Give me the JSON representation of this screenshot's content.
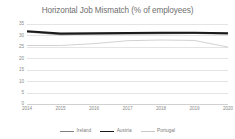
{
  "chart_data": {
    "type": "line",
    "title": "Horizontal Job Mismatch (% of employees)",
    "xlabel": "",
    "ylabel": "",
    "x": [
      "2014",
      "2015",
      "2016",
      "2017",
      "2018",
      "2019",
      "2020"
    ],
    "categories": [
      "2014",
      "2015",
      "2016",
      "2017",
      "2018",
      "2019",
      "2020"
    ],
    "ylim": [
      0,
      35
    ],
    "yticks": [
      35,
      30,
      25,
      20,
      15,
      10,
      5,
      0
    ],
    "grid": "horizontal",
    "legend_position": "bottom",
    "series": [
      {
        "name": "Ireland",
        "color": "#808080",
        "values": [
          31.6,
          30.5,
          30.7,
          30.8,
          30.9,
          31.0,
          30.8
        ]
      },
      {
        "name": "Austria",
        "color": "#1a1a1a",
        "values": [
          31.8,
          30.8,
          30.9,
          31.1,
          31.2,
          31.2,
          31.0
        ]
      },
      {
        "name": "Portugal",
        "color": "#c9c9c9",
        "values": [
          25.6,
          25.6,
          26.4,
          27.7,
          28.0,
          27.8,
          24.9
        ]
      }
    ]
  },
  "axes": {
    "y_tick_labels": [
      "35",
      "30",
      "25",
      "20",
      "15",
      "10",
      "5",
      "0"
    ],
    "x_tick_labels": [
      "2014",
      "2015",
      "2016",
      "2017",
      "2018",
      "2019",
      "2020"
    ]
  },
  "legend": {
    "items": [
      {
        "label": "Ireland",
        "color": "#808080",
        "width": "1.6px"
      },
      {
        "label": "Austria",
        "color": "#1a1a1a",
        "width": "1.8px"
      },
      {
        "label": "Portugal",
        "color": "#c9c9c9",
        "width": "0.9px"
      }
    ]
  },
  "colors": {
    "background": "#ffffff",
    "gridline": "#e4e4e4",
    "title_text": "#6f6f6f",
    "tick_text": "#8a8a8a"
  }
}
